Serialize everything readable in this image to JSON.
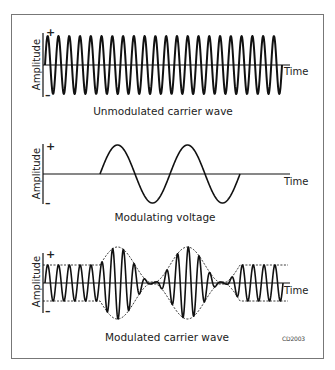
{
  "panels": [
    {
      "id": "unmodulated",
      "caption": "Unmodulated carrier wave",
      "y_axis_label": "Amplitude",
      "x_axis_label": "Time",
      "plus": "+",
      "minus": "–",
      "baseline_y": 65,
      "amplitude_px": 29,
      "x_start": 45,
      "x_end": 282,
      "carrier_cycles": 22
    },
    {
      "id": "modulating",
      "caption": "Modulating voltage",
      "y_axis_label": "Amplitude",
      "x_axis_label": "Time",
      "plus": "+",
      "minus": "–",
      "baseline_y": 174,
      "amplitude_px": 29,
      "x_start": 100,
      "x_end": 240,
      "modulation_cycles": 2
    },
    {
      "id": "modulated",
      "caption": "Modulated carrier wave",
      "y_axis_label": "Amplitude",
      "x_axis_label": "Time",
      "plus": "+",
      "minus": "–",
      "baseline_y": 283,
      "carrier_amplitude_px": 18,
      "x_start": 45,
      "x_end": 283,
      "mod_start": 100,
      "mod_end": 240,
      "carrier_cycles": 22
    }
  ],
  "figure_code": "CD2003",
  "colors": {
    "line": "#111111",
    "frame": "#777777"
  }
}
